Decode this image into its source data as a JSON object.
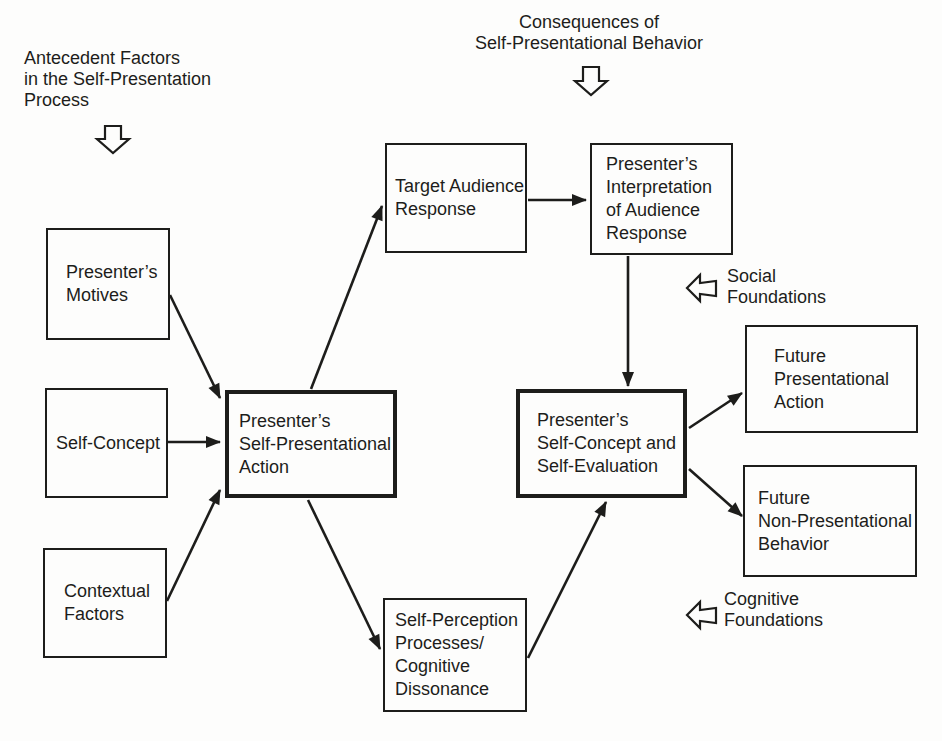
{
  "canvas": {
    "background": "#fdfdfc",
    "ink": "#1d1d1b"
  },
  "annotations": {
    "antecedent_label": "Antecedent Factors\nin the Self-Presentation\nProcess",
    "consequences_label": "Consequences of\nSelf-Presentational Behavior",
    "social_label": "Social\nFoundations",
    "cognitive_label": "Cognitive\nFoundations"
  },
  "boxes": {
    "presenters_motives": "Presenter’s\nMotives",
    "self_concept": "Self-Concept",
    "contextual_factors": "Contextual\nFactors",
    "presenters_action": "Presenter’s\nSelf-Presentational\nAction",
    "target_audience_response": "Target Audience\nResponse",
    "presenters_interpretation": "Presenter’s\nInterpretation\nof Audience\nResponse",
    "self_concept_evaluation": "Presenter’s\nSelf-Concept and\nSelf-Evaluation",
    "future_presentational_action": "Future\nPresentational\nAction",
    "future_non_presentational_behavior": "Future\nNon-Presentational\nBehavior",
    "self_perception": "Self-Perception\nProcesses/\nCognitive\nDissonance"
  }
}
